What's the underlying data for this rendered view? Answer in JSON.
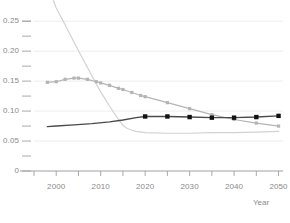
{
  "chart_data": {
    "type": "line",
    "title": "",
    "subtitle": "",
    "xlabel": "Year",
    "ylabel": "",
    "xlim": [
      1995,
      2051
    ],
    "ylim": [
      0,
      0.262
    ],
    "grid": true,
    "grid_axis": "y",
    "legend": "none",
    "x_major_ticks": [
      2000,
      2010,
      2020,
      2030,
      2040,
      2050
    ],
    "x_minor_ticks": [
      1995,
      2005,
      2015,
      2025,
      2035,
      2045
    ],
    "x_tick_labels": [
      "2000",
      "2010",
      "2020",
      "2030",
      "2040",
      "2050"
    ],
    "y_major_ticks": [
      0,
      0.05,
      0.1,
      0.15,
      0.2,
      0.25
    ],
    "y_minor_ticks": [
      0.025,
      0.075,
      0.125,
      0.175,
      0.225,
      0.25
    ],
    "y_tick_labels": [
      "0",
      "0.05",
      "0.10",
      "0.15",
      "0.20",
      "0.25"
    ],
    "series": [
      {
        "name": "steep-decline-series",
        "color": "#d2d2d2",
        "width": 1.2,
        "markers": "none",
        "x": [
          1999,
          2000,
          2002,
          2004,
          2006,
          2008,
          2010,
          2012,
          2014,
          2015,
          2016,
          2017,
          2018,
          2020,
          2025,
          2030,
          2035,
          2040,
          2045,
          2050
        ],
        "y": [
          0.292,
          0.272,
          0.244,
          0.215,
          0.187,
          0.159,
          0.132,
          0.108,
          0.086,
          0.076,
          0.071,
          0.068,
          0.066,
          0.064,
          0.063,
          0.063,
          0.064,
          0.064,
          0.065,
          0.066
        ]
      },
      {
        "name": "mid-gray-series",
        "color": "#b4b4b4",
        "width": 1.2,
        "markers": "square-small",
        "x": [
          1998,
          2000,
          2002,
          2004,
          2005,
          2007,
          2009,
          2010,
          2012,
          2014,
          2015,
          2017,
          2019,
          2020,
          2025,
          2030,
          2035,
          2040,
          2045,
          2050
        ],
        "y": [
          0.148,
          0.149,
          0.153,
          0.155,
          0.155,
          0.153,
          0.149,
          0.147,
          0.143,
          0.138,
          0.136,
          0.131,
          0.126,
          0.124,
          0.114,
          0.104,
          0.094,
          0.086,
          0.08,
          0.075
        ]
      },
      {
        "name": "dark-marker-series",
        "color": "#4a4a4a",
        "width": 1.4,
        "markers": "square",
        "x": [
          1998,
          2000,
          2004,
          2008,
          2012,
          2015,
          2018,
          2020,
          2025,
          2030,
          2035,
          2040,
          2045,
          2050
        ],
        "y": [
          0.074,
          0.075,
          0.077,
          0.079,
          0.082,
          0.085,
          0.089,
          0.091,
          0.091,
          0.09,
          0.089,
          0.089,
          0.09,
          0.092
        ],
        "marker_x": [
          2020,
          2025,
          2030,
          2035,
          2040,
          2045,
          2050
        ],
        "marker_y": [
          0.091,
          0.091,
          0.09,
          0.089,
          0.089,
          0.09,
          0.092
        ]
      }
    ],
    "colors": {
      "axis": "#a0a0a0",
      "grid": "#ededed",
      "tick_text": "#8a8a8a",
      "background": "#ffffff"
    }
  }
}
